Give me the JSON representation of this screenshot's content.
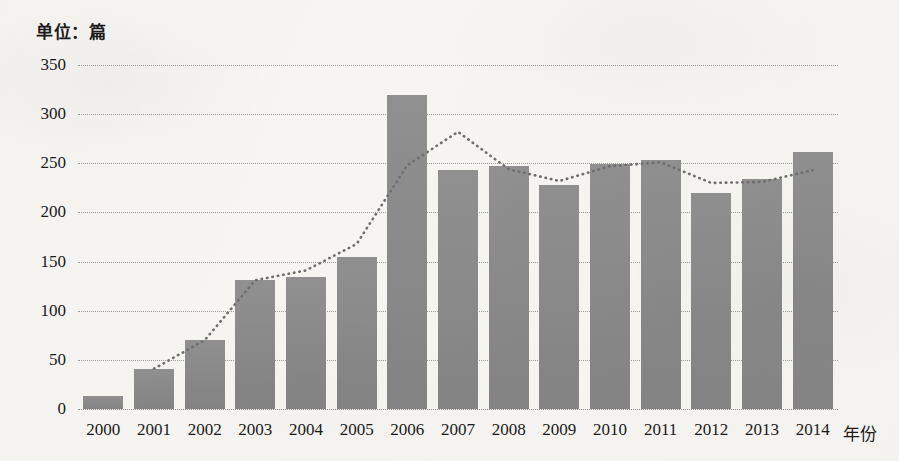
{
  "chart_data": {
    "type": "bar",
    "title": "单位：篇",
    "xlabel": "年份",
    "ylabel": "",
    "categories": [
      "2000",
      "2001",
      "2002",
      "2003",
      "2004",
      "2005",
      "2006",
      "2007",
      "2008",
      "2009",
      "2010",
      "2011",
      "2012",
      "2013",
      "2014"
    ],
    "values": [
      13,
      41,
      70,
      131,
      134,
      155,
      320,
      243,
      247,
      228,
      249,
      253,
      220,
      234,
      261
    ],
    "series": [
      {
        "name": "论文数量",
        "type": "bar",
        "values": [
          13,
          41,
          70,
          131,
          134,
          155,
          320,
          243,
          247,
          228,
          249,
          253,
          220,
          234,
          261
        ]
      },
      {
        "name": "趋势线",
        "type": "line",
        "style": "dotted",
        "values": [
          null,
          41,
          70,
          131,
          141,
          168,
          248,
          282,
          244,
          232,
          247,
          251,
          230,
          231,
          243
        ]
      }
    ],
    "ylim": [
      0,
      350
    ],
    "yticks": [
      0,
      50,
      100,
      150,
      200,
      250,
      300,
      350
    ],
    "ytick_labels": [
      "0",
      "50",
      "100",
      "150",
      "200",
      "250",
      "300",
      "350"
    ],
    "grid": true,
    "grid_style": "dotted-horizontal",
    "legend": "none",
    "colors": {
      "bar": "#8c8c8c",
      "grid": "#9a9a96",
      "trend": "#6f6f6f",
      "text": "#1a1a1a",
      "background": "#f6f5f2"
    }
  }
}
